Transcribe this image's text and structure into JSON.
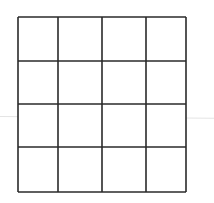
{
  "diagram": {
    "type": "grid",
    "rows": 4,
    "cols": 4,
    "line_color": "#2a2a2a",
    "background": "#ffffff",
    "x_lines": [
      18,
      58,
      102,
      146,
      186
    ],
    "y_lines": [
      17,
      61,
      104,
      147,
      192
    ],
    "cells": [
      [
        "",
        "",
        "",
        ""
      ],
      [
        "",
        "",
        "",
        ""
      ],
      [
        "",
        "",
        "",
        ""
      ],
      [
        "",
        "",
        "",
        ""
      ]
    ]
  }
}
